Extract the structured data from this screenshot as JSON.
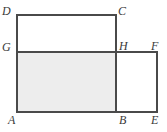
{
  "figure": {
    "kind": "geometry-diagram",
    "width": 167,
    "height": 132,
    "colors": {
      "background": "#ffffff",
      "stroke": "#4a4a4a",
      "shaded_fill": "#ededed",
      "label_color": "#3a3a3a"
    },
    "stroke_width": 2,
    "vertices": [
      {
        "name": "D",
        "label": "D",
        "x": 17,
        "y": 15
      },
      {
        "name": "C",
        "label": "C",
        "x": 116,
        "y": 15
      },
      {
        "name": "G",
        "label": "G",
        "x": 17,
        "y": 52
      },
      {
        "name": "H",
        "label": "H",
        "x": 116,
        "y": 52
      },
      {
        "name": "F",
        "label": "F",
        "x": 157,
        "y": 52
      },
      {
        "name": "A",
        "label": "A",
        "x": 17,
        "y": 112
      },
      {
        "name": "B",
        "label": "B",
        "x": 116,
        "y": 112
      },
      {
        "name": "E",
        "label": "E",
        "x": 157,
        "y": 112
      }
    ],
    "segments": [
      {
        "name": "DC",
        "x1": 17,
        "y1": 15,
        "x2": 116,
        "y2": 15
      },
      {
        "name": "DA",
        "x1": 17,
        "y1": 15,
        "x2": 17,
        "y2": 112
      },
      {
        "name": "CB",
        "x1": 116,
        "y1": 15,
        "x2": 116,
        "y2": 112
      },
      {
        "name": "GF",
        "x1": 17,
        "y1": 52,
        "x2": 157,
        "y2": 52
      },
      {
        "name": "FE",
        "x1": 157,
        "y1": 52,
        "x2": 157,
        "y2": 112
      },
      {
        "name": "AE",
        "x1": 17,
        "y1": 112,
        "x2": 157,
        "y2": 112
      }
    ],
    "shaded_region": {
      "name": "ABHG",
      "x": 17,
      "y": 52,
      "width": 99,
      "height": 60
    }
  }
}
